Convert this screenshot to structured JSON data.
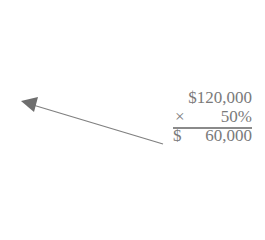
{
  "calculation": {
    "line1": "$120,000",
    "operator": "×",
    "line2_value": "50%",
    "result_currency": "$",
    "result_value": "60,000"
  },
  "arrow": {
    "icon": "arrow-left-icon",
    "color": "#808080"
  }
}
